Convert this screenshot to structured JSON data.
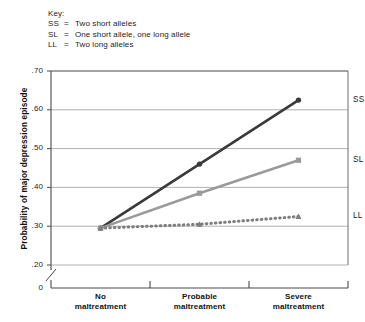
{
  "key": {
    "title": "Key:",
    "equals": "=",
    "entries": [
      {
        "code": "SS",
        "description": "Two short alleles"
      },
      {
        "code": "SL",
        "description": "One short allele, one long allele"
      },
      {
        "code": "LL",
        "description": "Two long alleles"
      }
    ]
  },
  "chart_data": {
    "type": "line",
    "title": "",
    "xlabel": "",
    "ylabel": "Probability of major depression episode",
    "categories": [
      "No maltreatment",
      "Probable maltreatment",
      "Severe maltreatment"
    ],
    "category_lines": [
      [
        "No",
        "maltreatment"
      ],
      [
        "Probable",
        "maltreatment"
      ],
      [
        "Severe",
        "maltreatment"
      ]
    ],
    "ylim": [
      0.2,
      0.7
    ],
    "yticks": [
      0.2,
      0.3,
      0.4,
      0.5,
      0.6,
      0.7
    ],
    "ytick_labels": [
      ".20",
      ".30",
      ".40",
      ".50",
      ".60",
      ".70"
    ],
    "y_origin_label": "0",
    "axis_break": true,
    "grid": true,
    "legend_position": "right-of-line-end",
    "series": [
      {
        "name": "SS",
        "label": "SS",
        "values": [
          0.295,
          0.46,
          0.625
        ],
        "color": "#3a3a3a",
        "style": "solid",
        "marker": "circle"
      },
      {
        "name": "SL",
        "label": "SL",
        "values": [
          0.295,
          0.385,
          0.47
        ],
        "color": "#9a9a9a",
        "style": "solid",
        "marker": "square"
      },
      {
        "name": "LL",
        "label": "LL",
        "values": [
          0.295,
          0.305,
          0.325
        ],
        "color": "#7d7d7d",
        "style": "dotted",
        "marker": "triangle"
      }
    ]
  }
}
